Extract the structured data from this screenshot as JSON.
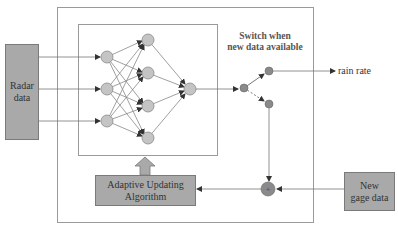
{
  "diagram": {
    "blocks": {
      "radar": {
        "label_line1": "Radar",
        "label_line2": "data"
      },
      "adaptive": {
        "label_line1": "Adaptive Updating",
        "label_line2": "Algorithm"
      },
      "gage": {
        "label_line1": "New",
        "label_line2": "gage data"
      }
    },
    "switch_label": {
      "line1": "Switch when",
      "line2": "new data available"
    },
    "output_label": "rain rate",
    "neural_network": {
      "input_nodes": 3,
      "hidden_nodes": 4,
      "output_nodes": 1
    },
    "summation_symbol": "+",
    "colors": {
      "block_fill": "#a9a9a9",
      "node_fill": "#c4c4c4",
      "switch_node_fill": "#8a8a8a",
      "line": "#777777",
      "frame": "#9a9a9a"
    }
  }
}
